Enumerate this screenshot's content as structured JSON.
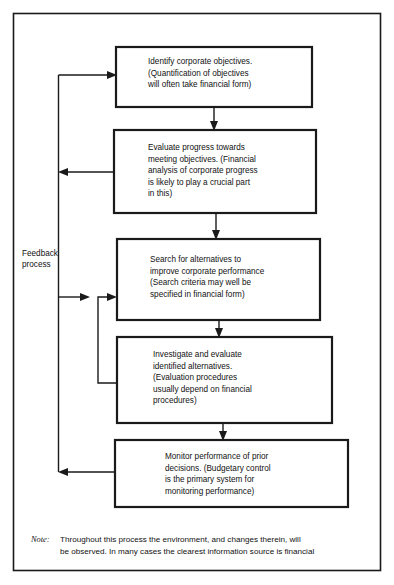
{
  "figure": {
    "line_color": "#1a1a1a",
    "background_color": "#ffffff"
  },
  "rail": {
    "label_line_1": "Feedback",
    "label_line_2": "process"
  },
  "boxes": [
    {
      "id": "identify-objectives",
      "lines": [
        "Identify corporate objectives.",
        "(Quantification of objectives",
        "will often take financial form)"
      ]
    },
    {
      "id": "evaluate-progress",
      "lines": [
        "Evaluate progress towards",
        "meeting objectives. (Financial",
        "analysis of corporate progress",
        "is likely to play a crucial part",
        "in this)"
      ]
    },
    {
      "id": "search-alternatives",
      "lines": [
        "Search for alternatives to",
        "improve corporate performance",
        "(Search criteria may well be",
        "specified in financial form)"
      ]
    },
    {
      "id": "investigate-evaluate",
      "lines": [
        "Investigate and evaluate",
        "identified alternatives.",
        "(Evaluation procedures",
        "usually depend on financial",
        "procedures)"
      ]
    },
    {
      "id": "monitor-performance",
      "lines": [
        "Monitor performance of prior",
        "decisions.  (Budgetary control",
        "is the primary system for",
        "monitoring performance)"
      ]
    }
  ],
  "note": {
    "label": "Note:",
    "line_1": "Throughout this process the environment, and changes therein, will",
    "line_2": "be observed.  In many cases the clearest information source is financial"
  }
}
